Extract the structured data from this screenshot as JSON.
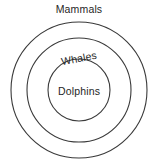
{
  "diagram": {
    "type": "euler-nested-circles",
    "background_color": "#ffffff",
    "stroke_color": "#3a3a3a",
    "text_color": "#262626",
    "labels": {
      "outer": "Mammals",
      "middle": "Whales",
      "inner": "Dolphins"
    },
    "circles": [
      {
        "name": "mammals-circle",
        "cx": 79,
        "cy": 90,
        "r": 68
      },
      {
        "name": "whales-circle",
        "cx": 79,
        "cy": 90,
        "r": 52
      },
      {
        "name": "dolphins-circle",
        "cx": 79,
        "cy": 90,
        "r": 31
      }
    ]
  }
}
